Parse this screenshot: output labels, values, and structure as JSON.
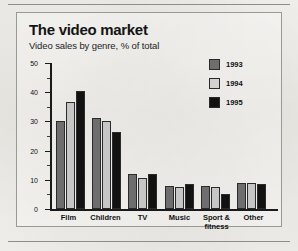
{
  "chart_data": {
    "type": "bar",
    "title": "The video market",
    "subtitle": "Video sales by genre, % of total",
    "xlabel": "",
    "ylabel": "",
    "ylim": [
      0,
      50
    ],
    "yticks": [
      0,
      10,
      20,
      30,
      40,
      50
    ],
    "ytick_labels": [
      "0",
      "10",
      "20",
      "30",
      "40",
      "50"
    ],
    "minor_ticks": [
      5,
      15,
      25,
      35,
      45
    ],
    "grid": false,
    "legend_position": "top-right",
    "categories": [
      "Film",
      "Children",
      "TV",
      "Music",
      "Sport & fitness",
      "Other"
    ],
    "series": [
      {
        "name": "1993",
        "color": "#6e6e6e",
        "values": [
          30,
          31,
          12,
          8,
          8,
          9
        ]
      },
      {
        "name": "1994",
        "color": "#c6c6c6",
        "values": [
          36.5,
          30,
          10.5,
          7.5,
          7.5,
          9
        ]
      },
      {
        "name": "1995",
        "color": "#121212",
        "values": [
          40.5,
          26.5,
          12,
          8.5,
          5,
          8.5
        ]
      }
    ]
  },
  "legend": {
    "items": [
      {
        "label": "1993",
        "color": "#6e6e6e"
      },
      {
        "label": "1994",
        "color": "#d2d2d2"
      },
      {
        "label": "1995",
        "color": "#121212"
      }
    ]
  },
  "axis": {
    "y_labels": [
      "50",
      "40",
      "30",
      "20",
      "10",
      "0"
    ]
  },
  "xaxis": {
    "labels": [
      {
        "line1": "Film",
        "line2": ""
      },
      {
        "line1": "Children",
        "line2": ""
      },
      {
        "line1": "TV",
        "line2": ""
      },
      {
        "line1": "Music",
        "line2": ""
      },
      {
        "line1": "Sport &",
        "line2": "fitness"
      },
      {
        "line1": "Other",
        "line2": ""
      }
    ]
  }
}
